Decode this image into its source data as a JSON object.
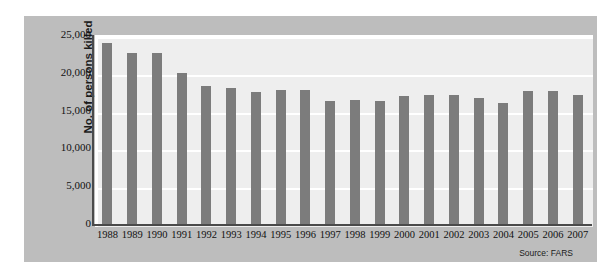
{
  "chart_data": {
    "type": "bar",
    "title": "",
    "xlabel": "",
    "ylabel": "No. of persons killed",
    "ylim": [
      0,
      25000
    ],
    "yticks": [
      0,
      5000,
      10000,
      15000,
      20000,
      25000
    ],
    "ytick_labels": [
      "0",
      "5,000",
      "10,000",
      "15,000",
      "20,000",
      "25,000"
    ],
    "grid": true,
    "legend": "none",
    "source": "Source: FARS",
    "bar_color": "#7c7c7c",
    "plot_bg": "#eeeeee",
    "panel_bg": "#bdbdbd",
    "categories": [
      "1988",
      "1989",
      "1990",
      "1991",
      "1992",
      "1993",
      "1994",
      "1995",
      "1996",
      "1997",
      "1998",
      "1999",
      "2000",
      "2001",
      "2002",
      "2003",
      "2004",
      "2005",
      "2006",
      "2007"
    ],
    "values": [
      23900,
      22600,
      22600,
      20000,
      18300,
      18000,
      17400,
      17700,
      17700,
      16300,
      16400,
      16300,
      16900,
      17000,
      17000,
      16700,
      16000,
      17600,
      17600,
      17100
    ],
    "series": [
      {
        "name": "No. of persons killed",
        "values": [
          23900,
          22600,
          22600,
          20000,
          18300,
          18000,
          17400,
          17700,
          17700,
          16300,
          16400,
          16300,
          16900,
          17000,
          17000,
          16700,
          16000,
          17600,
          17600,
          17100
        ]
      }
    ]
  }
}
